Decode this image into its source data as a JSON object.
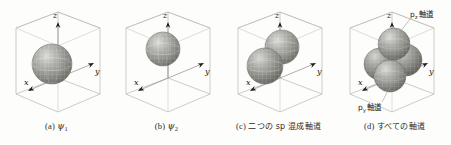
{
  "figure": {
    "type": "scientific-illustration",
    "background_color": "#fdfdfc",
    "line_color": "#b5b5b0",
    "sphere_color": "#8f8f8a"
  },
  "axes": {
    "x": "x",
    "y": "y",
    "z": "z"
  },
  "panels": [
    {
      "id": "panel-a",
      "caption_index": "(a)",
      "caption_symbol": "ψ",
      "caption_subscript": "1",
      "caption_text": "",
      "spheres": [
        {
          "cx": 52,
          "cy": 62,
          "r": 20
        }
      ],
      "labels": []
    },
    {
      "id": "panel-b",
      "caption_index": "(b)",
      "caption_symbol": "ψ",
      "caption_subscript": "2",
      "caption_text": "",
      "spheres": [
        {
          "cx": 53,
          "cy": 47,
          "r": 17
        }
      ],
      "labels": []
    },
    {
      "id": "panel-c",
      "caption_index": "(c)",
      "caption_symbol": "",
      "caption_subscript": "",
      "caption_text": "二つの sp 混成軸道",
      "spheres": [
        {
          "cx": 60,
          "cy": 45,
          "r": 17
        },
        {
          "cx": 43,
          "cy": 64,
          "r": 18
        }
      ],
      "labels": []
    },
    {
      "id": "panel-d",
      "caption_index": "(d)",
      "caption_symbol": "",
      "caption_subscript": "",
      "caption_text": "すべての軸道",
      "spheres": [
        {
          "cx": 42,
          "cy": 62,
          "r": 16
        },
        {
          "cx": 68,
          "cy": 58,
          "r": 16
        },
        {
          "cx": 52,
          "cy": 72,
          "r": 16
        },
        {
          "cx": 56,
          "cy": 42,
          "r": 16
        }
      ],
      "labels": [
        {
          "name": "pz-orbital-label",
          "text": "p",
          "subscript": "z",
          "suffix": "軸道",
          "x": 74,
          "y": 12
        },
        {
          "name": "py-orbital-label",
          "text": "p",
          "subscript": "y",
          "suffix": "軸道",
          "x": 22,
          "y": 108
        }
      ]
    }
  ]
}
